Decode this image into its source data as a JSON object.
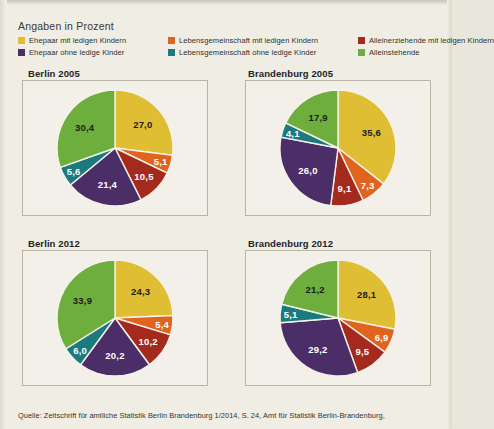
{
  "legend": {
    "title": "Angaben in Prozent",
    "items": [
      {
        "label": "Ehepaar mit ledigen Kindern",
        "color": "#e0be33",
        "key": "ehepaar_mit_kindern"
      },
      {
        "label": "Lebensgemeinschaft mit ledigen Kindern",
        "color": "#e0631e",
        "key": "lg_mit_kindern"
      },
      {
        "label": "Alleinerziehende mit ledigen Kindern",
        "color": "#a52a1e",
        "key": "alleinerziehende"
      },
      {
        "label": "Ehepaar ohne ledige Kinder",
        "color": "#4b2d68",
        "key": "ehepaar_ohne_kinder"
      },
      {
        "label": "Lebensgemeinschaft ohne ledige Kinder",
        "color": "#1c7a7e",
        "key": "lg_ohne_kinder"
      },
      {
        "label": "Alleinstehende",
        "color": "#6dae3c",
        "key": "alleinstehende"
      }
    ]
  },
  "panels": [
    {
      "title": "Berlin 2005"
    },
    {
      "title": "Brandenburg 2005"
    },
    {
      "title": "Berlin 2012"
    },
    {
      "title": "Brandenburg 2012"
    }
  ],
  "source": {
    "text": "Quelle: Zeitschrift für amtliche Statistik Berlin Brandenburg 1/2014, S. 24, Amt für Statistik Berlin-Brandenburg,"
  },
  "chart_data": [
    {
      "type": "pie",
      "title": "Berlin 2005",
      "unit": "Prozent",
      "categories": [
        "Ehepaar mit ledigen Kindern",
        "Lebensgemeinschaft mit ledigen Kindern",
        "Alleinerziehende mit ledigen Kindern",
        "Ehepaar ohne ledige Kinder",
        "Lebensgemeinschaft ohne ledige Kinder",
        "Alleinstehende"
      ],
      "values": [
        27.0,
        5.1,
        10.5,
        21.4,
        5.6,
        30.4
      ],
      "labels": [
        "27,0",
        "5,1",
        "10,5",
        "21,4",
        "5,6",
        "30,4"
      ],
      "colors": [
        "#e0be33",
        "#e0631e",
        "#a52a1e",
        "#4b2d68",
        "#1c7a7e",
        "#6dae3c"
      ],
      "label_colors": [
        "dark",
        "light",
        "light",
        "light",
        "light",
        "dark"
      ],
      "start_angle": 0,
      "direction": "clockwise",
      "legend_position": "top"
    },
    {
      "type": "pie",
      "title": "Brandenburg 2005",
      "unit": "Prozent",
      "categories": [
        "Ehepaar mit ledigen Kindern",
        "Lebensgemeinschaft mit ledigen Kindern",
        "Alleinerziehende mit ledigen Kindern",
        "Ehepaar ohne ledige Kinder",
        "Lebensgemeinschaft ohne ledige Kinder",
        "Alleinstehende"
      ],
      "values": [
        35.6,
        7.3,
        9.1,
        26.0,
        4.1,
        17.9
      ],
      "labels": [
        "35,6",
        "7,3",
        "9,1",
        "26,0",
        "4,1",
        "17,9"
      ],
      "colors": [
        "#e0be33",
        "#e0631e",
        "#a52a1e",
        "#4b2d68",
        "#1c7a7e",
        "#6dae3c"
      ],
      "label_colors": [
        "dark",
        "light",
        "light",
        "light",
        "light",
        "dark"
      ],
      "start_angle": 0,
      "direction": "clockwise",
      "legend_position": "top"
    },
    {
      "type": "pie",
      "title": "Berlin 2012",
      "unit": "Prozent",
      "categories": [
        "Ehepaar mit ledigen Kindern",
        "Lebensgemeinschaft mit ledigen Kindern",
        "Alleinerziehende mit ledigen Kindern",
        "Ehepaar ohne ledige Kinder",
        "Lebensgemeinschaft ohne ledige Kinder",
        "Alleinstehende"
      ],
      "values": [
        24.3,
        5.4,
        10.2,
        20.2,
        6.0,
        33.9
      ],
      "labels": [
        "24,3",
        "5,4",
        "10,2",
        "20,2",
        "6,0",
        "33,9"
      ],
      "colors": [
        "#e0be33",
        "#e0631e",
        "#a52a1e",
        "#4b2d68",
        "#1c7a7e",
        "#6dae3c"
      ],
      "label_colors": [
        "dark",
        "light",
        "light",
        "light",
        "light",
        "dark"
      ],
      "start_angle": 0,
      "direction": "clockwise",
      "legend_position": "top"
    },
    {
      "type": "pie",
      "title": "Brandenburg 2012",
      "unit": "Prozent",
      "categories": [
        "Ehepaar mit ledigen Kindern",
        "Lebensgemeinschaft mit ledigen Kindern",
        "Alleinerziehende mit ledigen Kindern",
        "Ehepaar ohne ledige Kinder",
        "Lebensgemeinschaft ohne ledige Kinder",
        "Alleinstehende"
      ],
      "values": [
        28.1,
        6.9,
        9.5,
        29.2,
        5.1,
        21.2
      ],
      "labels": [
        "28,1",
        "6,9",
        "9,5",
        "29,2",
        "5,1",
        "21,2"
      ],
      "colors": [
        "#e0be33",
        "#e0631e",
        "#a52a1e",
        "#4b2d68",
        "#1c7a7e",
        "#6dae3c"
      ],
      "label_colors": [
        "dark",
        "light",
        "light",
        "light",
        "light",
        "dark"
      ],
      "start_angle": 0,
      "direction": "clockwise",
      "legend_position": "top"
    }
  ]
}
